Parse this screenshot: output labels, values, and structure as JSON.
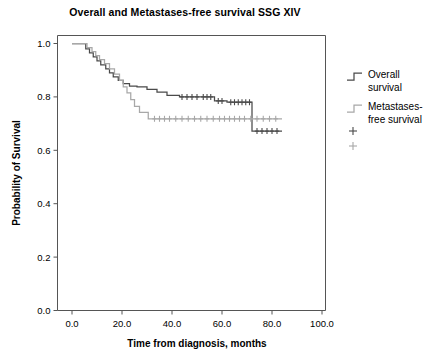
{
  "chart_data": {
    "type": "line",
    "title": "Overall and Metastases-free survival SSG XIV",
    "xlabel": "Time from diagnosis, months",
    "ylabel": "Probability of Survival",
    "xlim": [
      0,
      100
    ],
    "ylim": [
      0.0,
      1.0
    ],
    "grid": false,
    "legend_position": "right",
    "xticks": [
      "0.0",
      "20.0",
      "40.0",
      "60.0",
      "80.0",
      "100.0"
    ],
    "xtick_values": [
      0,
      20,
      40,
      60,
      80,
      100
    ],
    "yticks": [
      "0.0",
      "0.2",
      "0.4",
      "0.6",
      "0.8",
      "1.0"
    ],
    "ytick_values": [
      0.0,
      0.2,
      0.4,
      0.6,
      0.8,
      1.0
    ],
    "colors": {
      "overall": "#4a4a4a",
      "metastases_free": "#a8a8a8",
      "axis": "#555555"
    },
    "series": [
      {
        "name": "Overall survival",
        "legend_label": "Overall\nsurvival",
        "color": "#4a4a4a",
        "step_points": [
          [
            0.0,
            1.0
          ],
          [
            5.5,
            1.0
          ],
          [
            5.5,
            0.98
          ],
          [
            7.0,
            0.98
          ],
          [
            7.0,
            0.965
          ],
          [
            8.5,
            0.965
          ],
          [
            8.5,
            0.95
          ],
          [
            10.0,
            0.95
          ],
          [
            10.0,
            0.935
          ],
          [
            11.5,
            0.935
          ],
          [
            11.5,
            0.92
          ],
          [
            13.5,
            0.92
          ],
          [
            13.5,
            0.905
          ],
          [
            15.0,
            0.905
          ],
          [
            15.0,
            0.89
          ],
          [
            16.5,
            0.89
          ],
          [
            16.5,
            0.875
          ],
          [
            18.5,
            0.875
          ],
          [
            18.5,
            0.862
          ],
          [
            20.5,
            0.862
          ],
          [
            20.5,
            0.85
          ],
          [
            23.0,
            0.85
          ],
          [
            23.0,
            0.84
          ],
          [
            26.0,
            0.84
          ],
          [
            26.0,
            0.838
          ],
          [
            30.0,
            0.838
          ],
          [
            30.0,
            0.828
          ],
          [
            34.0,
            0.828
          ],
          [
            34.0,
            0.818
          ],
          [
            38.0,
            0.818
          ],
          [
            38.0,
            0.806
          ],
          [
            43.0,
            0.806
          ],
          [
            43.0,
            0.8
          ],
          [
            57.0,
            0.8
          ],
          [
            57.0,
            0.785
          ],
          [
            62.0,
            0.785
          ],
          [
            62.0,
            0.78
          ],
          [
            72.0,
            0.78
          ],
          [
            72.0,
            0.672
          ],
          [
            84.0,
            0.672
          ]
        ],
        "censor_times": [
          44.0,
          46.0,
          48.0,
          50.0,
          52.5,
          54.0,
          55.5,
          58.5,
          60.0,
          63.5,
          65.0,
          66.5,
          68.0,
          69.5,
          71.0,
          74.0,
          76.0,
          78.0,
          80.0,
          82.0
        ],
        "censor_levels": [
          0.8,
          0.8,
          0.8,
          0.8,
          0.8,
          0.8,
          0.8,
          0.785,
          0.785,
          0.78,
          0.78,
          0.78,
          0.78,
          0.78,
          0.78,
          0.672,
          0.672,
          0.672,
          0.672,
          0.672
        ]
      },
      {
        "name": "Metastases-free survival",
        "legend_label": "Metastases-\nfree survival",
        "color": "#a8a8a8",
        "step_points": [
          [
            0.0,
            1.0
          ],
          [
            6.0,
            1.0
          ],
          [
            6.0,
            0.985
          ],
          [
            8.0,
            0.985
          ],
          [
            8.0,
            0.97
          ],
          [
            9.5,
            0.97
          ],
          [
            9.5,
            0.955
          ],
          [
            11.0,
            0.955
          ],
          [
            11.0,
            0.94
          ],
          [
            13.0,
            0.94
          ],
          [
            13.0,
            0.925
          ],
          [
            15.0,
            0.925
          ],
          [
            15.0,
            0.905
          ],
          [
            17.0,
            0.905
          ],
          [
            17.0,
            0.885
          ],
          [
            19.0,
            0.885
          ],
          [
            19.0,
            0.862
          ],
          [
            20.5,
            0.862
          ],
          [
            20.5,
            0.838
          ],
          [
            22.0,
            0.838
          ],
          [
            22.0,
            0.815
          ],
          [
            23.5,
            0.815
          ],
          [
            23.5,
            0.79
          ],
          [
            25.0,
            0.79
          ],
          [
            25.0,
            0.765
          ],
          [
            27.0,
            0.765
          ],
          [
            27.0,
            0.742
          ],
          [
            30.5,
            0.742
          ],
          [
            30.5,
            0.718
          ],
          [
            84.0,
            0.718
          ]
        ],
        "censor_times": [
          33.0,
          35.0,
          37.0,
          39.0,
          41.5,
          44.0,
          46.5,
          49.0,
          51.5,
          54.0,
          56.5,
          59.0,
          61.0,
          63.0,
          65.0,
          67.0,
          69.0,
          71.5,
          74.0,
          76.5,
          79.0,
          81.5
        ],
        "censor_levels": [
          0.718,
          0.718,
          0.718,
          0.718,
          0.718,
          0.718,
          0.718,
          0.718,
          0.718,
          0.718,
          0.718,
          0.718,
          0.718,
          0.718,
          0.718,
          0.718,
          0.718,
          0.718,
          0.718,
          0.718,
          0.718,
          0.718
        ]
      }
    ]
  },
  "legend": {
    "entries": [
      {
        "label_line1": "Overall",
        "label_line2": "survival",
        "symbol": "step-line-dark"
      },
      {
        "label_line1": "Metastases-",
        "label_line2": "free survival",
        "symbol": "step-line-gray"
      }
    ],
    "censor_markers": [
      {
        "symbol": "plus-marker-dark"
      },
      {
        "symbol": "plus-marker-gray"
      }
    ]
  }
}
